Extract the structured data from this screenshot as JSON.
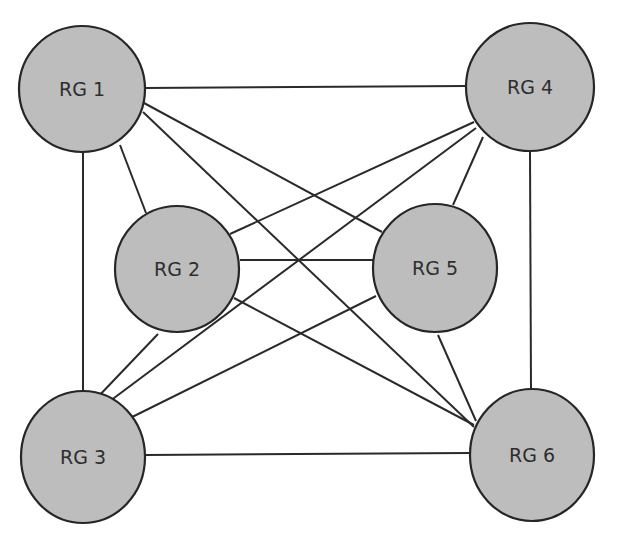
{
  "diagram": {
    "type": "complete-graph",
    "colors": {
      "node_fill": "#bdbdbd",
      "node_stroke": "#262626",
      "edge": "#2a2a2a",
      "label": "#2e2e2e",
      "background": "#ffffff"
    },
    "nodes": [
      {
        "id": "rg1",
        "label": "RG 1",
        "cx": 82,
        "cy": 89,
        "rx": 63,
        "ry": 63
      },
      {
        "id": "rg2",
        "label": "RG 2",
        "cx": 177,
        "cy": 269,
        "rx": 62,
        "ry": 63
      },
      {
        "id": "rg3",
        "label": "RG 3",
        "cx": 83,
        "cy": 457,
        "rx": 62,
        "ry": 66
      },
      {
        "id": "rg4",
        "label": "RG 4",
        "cx": 530,
        "cy": 87,
        "rx": 64,
        "ry": 64
      },
      {
        "id": "rg5",
        "label": "RG 5",
        "cx": 435,
        "cy": 268,
        "rx": 62,
        "ry": 64
      },
      {
        "id": "rg6",
        "label": "RG 6",
        "cx": 532,
        "cy": 455,
        "rx": 62,
        "ry": 66
      }
    ],
    "edges": [
      {
        "from": "rg1",
        "to": "rg4",
        "x1": 145,
        "y1": 88,
        "x2": 466,
        "y2": 86
      },
      {
        "from": "rg1",
        "to": "rg2",
        "x1": 120,
        "y1": 145,
        "x2": 146,
        "y2": 213
      },
      {
        "from": "rg1",
        "to": "rg3",
        "x1": 83,
        "y1": 152,
        "x2": 83,
        "y2": 391
      },
      {
        "from": "rg1",
        "to": "rg5",
        "x1": 144,
        "y1": 103,
        "x2": 382,
        "y2": 232
      },
      {
        "from": "rg1",
        "to": "rg6",
        "x1": 143,
        "y1": 112,
        "x2": 474,
        "y2": 427
      },
      {
        "from": "rg4",
        "to": "rg2",
        "x1": 474,
        "y1": 122,
        "x2": 230,
        "y2": 234
      },
      {
        "from": "rg4",
        "to": "rg3",
        "x1": 476,
        "y1": 128,
        "x2": 106,
        "y2": 404
      },
      {
        "from": "rg4",
        "to": "rg5",
        "x1": 483,
        "y1": 137,
        "x2": 453,
        "y2": 205
      },
      {
        "from": "rg4",
        "to": "rg6",
        "x1": 530,
        "y1": 152,
        "x2": 531,
        "y2": 389
      },
      {
        "from": "rg2",
        "to": "rg5",
        "x1": 240,
        "y1": 260,
        "x2": 373,
        "y2": 260
      },
      {
        "from": "rg2",
        "to": "rg3",
        "x1": 158,
        "y1": 334,
        "x2": 95,
        "y2": 400
      },
      {
        "from": "rg2",
        "to": "rg6",
        "x1": 234,
        "y1": 298,
        "x2": 474,
        "y2": 425
      },
      {
        "from": "rg5",
        "to": "rg3",
        "x1": 376,
        "y1": 296,
        "x2": 120,
        "y2": 423
      },
      {
        "from": "rg5",
        "to": "rg6",
        "x1": 438,
        "y1": 335,
        "x2": 476,
        "y2": 421
      },
      {
        "from": "rg3",
        "to": "rg6",
        "x1": 146,
        "y1": 455,
        "x2": 469,
        "y2": 453
      }
    ]
  }
}
